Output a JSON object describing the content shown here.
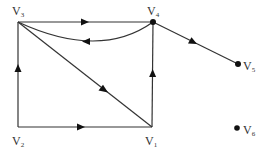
{
  "diagram": {
    "type": "directed-graph",
    "nodes": [
      {
        "id": "V1",
        "letter": "V",
        "sub": "1",
        "x": 152,
        "y": 127,
        "dot": false,
        "label_x": 145,
        "label_y": 135
      },
      {
        "id": "V2",
        "letter": "V",
        "sub": "2",
        "x": 18,
        "y": 127,
        "dot": false,
        "label_x": 12,
        "label_y": 135
      },
      {
        "id": "V3",
        "letter": "V",
        "sub": "3",
        "x": 18,
        "y": 22,
        "dot": false,
        "label_x": 12,
        "label_y": 6
      },
      {
        "id": "V4",
        "letter": "V",
        "sub": "4",
        "x": 153,
        "y": 22,
        "dot": true,
        "label_x": 147,
        "label_y": 6
      },
      {
        "id": "V5",
        "letter": "V",
        "sub": "5",
        "x": 238,
        "y": 64,
        "dot": true,
        "label_x": 243,
        "label_y": 60
      },
      {
        "id": "V6",
        "letter": "V",
        "sub": "6",
        "sub_uncertain": true,
        "x": 237,
        "y": 128,
        "dot": true,
        "label_x": 243,
        "label_y": 124
      }
    ],
    "edges": [
      {
        "from": "V3",
        "to": "V4",
        "kind": "straight"
      },
      {
        "from": "V4",
        "to": "V3",
        "kind": "curved"
      },
      {
        "from": "V3",
        "to": "V1",
        "kind": "straight"
      },
      {
        "from": "V2",
        "to": "V3",
        "kind": "straight"
      },
      {
        "from": "V2",
        "to": "V1",
        "kind": "straight"
      },
      {
        "from": "V1",
        "to": "V4",
        "kind": "straight"
      },
      {
        "from": "V4",
        "to": "V5",
        "kind": "straight"
      }
    ],
    "isolated_nodes": [
      "V6"
    ]
  },
  "labels": {
    "v1": {
      "letter": "V",
      "sub": "1"
    },
    "v2": {
      "letter": "V",
      "sub": "2"
    },
    "v3": {
      "letter": "V",
      "sub": "3"
    },
    "v4": {
      "letter": "V",
      "sub": "4"
    },
    "v5": {
      "letter": "V",
      "sub": "5"
    },
    "v6": {
      "letter": "V",
      "sub": "6"
    }
  },
  "colors": {
    "edge": "#333333",
    "node": "#111111",
    "text": "#333333",
    "background": "#ffffff"
  }
}
